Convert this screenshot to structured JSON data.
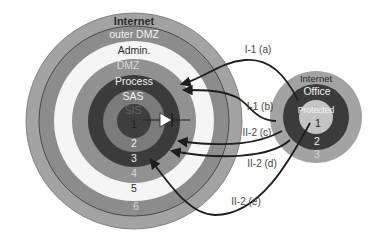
{
  "diagram": {
    "type": "nested-zone-rings",
    "colors": {
      "background": "#ffffff",
      "arrow": "#1e1e1e"
    },
    "main_zones": {
      "name": "plant-network",
      "rings": [
        {
          "label": "Internet",
          "level": "",
          "fill": "#a3a3a3",
          "text_color": "#2a2a2a"
        },
        {
          "label": "outer DMZ",
          "level": "6",
          "fill": "#8c8c8c",
          "text_color": "#eeeeee"
        },
        {
          "label": "Admin.",
          "level": "5",
          "fill": "#f5f5f5",
          "text_color": "#2a2a2a"
        },
        {
          "label": "DMZ",
          "level": "4",
          "fill": "#919191",
          "text_color": "#eeeeee"
        },
        {
          "label": "Process",
          "level": "3",
          "fill": "#3b3b3b",
          "text_color": "#eeeeee"
        },
        {
          "label": "SAS",
          "level": "2",
          "fill": "#7b7b7b",
          "text_color": "#eeeeee"
        },
        {
          "label": "SIS",
          "level": "1",
          "fill": "#3e3e3e",
          "text_color": "#6a6a6a"
        }
      ]
    },
    "remote_zones": {
      "name": "office-network",
      "rings": [
        {
          "label": "Internet",
          "level": "",
          "fill": "#a3a3a3",
          "text_color": "#2a2a2a"
        },
        {
          "label": "Office",
          "level": "3",
          "fill": "#3b3b3b",
          "text_color": "#eeeeee"
        },
        {
          "label": "Protected",
          "level": "2",
          "fill": "#3b3b3b",
          "text_color": "#eeeeee"
        },
        {
          "label": "",
          "level": "1",
          "fill": "#c4c4c4",
          "text_color": "#2a2a2a"
        }
      ],
      "office_label": "Office",
      "protected_label": "Protected",
      "level_labels": [
        "1",
        "2",
        "3"
      ]
    },
    "flows": [
      {
        "id": "I-1 (a)",
        "from": "Office",
        "to": "Process"
      },
      {
        "id": "I-1 (b)",
        "from": "Protected",
        "to": "Process"
      },
      {
        "id": "II-2 (c)",
        "from": "Office",
        "to": "SAS 2"
      },
      {
        "id": "II-2 (d)",
        "from": "Office",
        "to": "Process 3"
      },
      {
        "id": "II-2 (e)",
        "from": "Protected 1",
        "to": "Process 3"
      }
    ],
    "center_marker": "one-way-diode-arrow"
  }
}
